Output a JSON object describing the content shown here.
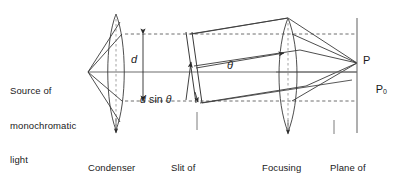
{
  "figure": {
    "type": "optics-ray-diagram",
    "title_implicit": "Fraunhofer single-slit diffraction setup",
    "background_color": "#ffffff",
    "line_color": "#3a3a3a",
    "text_color": "#1a1a1a"
  },
  "labels": {
    "source": "Source of\nmonochromatic\nlight",
    "source_line1": "Source of",
    "source_line2": "monochromatic",
    "source_line3": "light",
    "condenser": "Condenser\nlens",
    "condenser_line1": "Condenser",
    "condenser_line2": "lens",
    "slit_line1": "Slit of",
    "slit_line2_pre": "width ",
    "slit_line2_var": "d",
    "focusing_line1": "Focusing",
    "focusing_line2": "lens",
    "plane_line1": "Plane of",
    "plane_line2": "diffraction",
    "plane_line3": "pattern",
    "point_P": "P",
    "point_P0_base": "P",
    "point_P0_sub": "0",
    "dim_d": "d",
    "dim_dsin_pre": "d",
    "dim_dsin_mid": " sin ",
    "dim_dsin_theta": "θ",
    "angle_theta": "θ"
  },
  "geometry": {
    "axis_y": 72,
    "source_x": 88,
    "condenser_center_x": 116,
    "slit_x": 190,
    "focusing_center_x": 288,
    "screen_x": 357,
    "top_dashed_y": 34,
    "bottom_dashed_y": 101,
    "point_P_y": 63,
    "point_P0_y": 80
  }
}
